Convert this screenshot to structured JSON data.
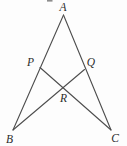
{
  "diagram": {
    "canvas": {
      "width": 127,
      "height": 146,
      "background": "#fdfdfd"
    },
    "stroke": {
      "color": "#4d4d4d",
      "width": 1.1
    },
    "label_style": {
      "color": "#2b2b2b",
      "font_size": 11.5
    },
    "points": {
      "A": {
        "x": 63.5,
        "y": 15
      },
      "B": {
        "x": 13,
        "y": 130
      },
      "C": {
        "x": 111,
        "y": 130
      },
      "P": {
        "x": 40,
        "y": 67.5
      },
      "Q": {
        "x": 84.5,
        "y": 69.5
      },
      "R": {
        "x": 63,
        "y": 87.7
      }
    },
    "segments": [
      {
        "from": "A",
        "to": "B"
      },
      {
        "from": "A",
        "to": "C"
      },
      {
        "from": "P",
        "to": "C"
      },
      {
        "from": "B",
        "to": "Q"
      }
    ],
    "labels": [
      {
        "text": "A",
        "x": 63,
        "y": 11
      },
      {
        "text": "B",
        "x": 9.5,
        "y": 143
      },
      {
        "text": "C",
        "x": 115,
        "y": 141.5
      },
      {
        "text": "P",
        "x": 30.5,
        "y": 66
      },
      {
        "text": "Q",
        "x": 91,
        "y": 66
      },
      {
        "text": "R",
        "x": 63.5,
        "y": 102
      }
    ],
    "artifact": {
      "x": 47,
      "y": 0,
      "width": 5.5,
      "height": 1.6,
      "color": "#8d8d8d"
    }
  }
}
